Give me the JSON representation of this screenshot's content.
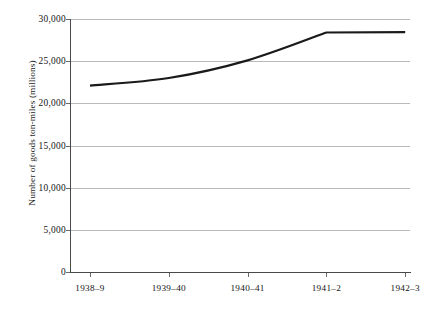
{
  "chart_data": {
    "type": "line",
    "title": "",
    "xlabel": "",
    "ylabel": "Number of goods ton-miles (millions)",
    "categories": [
      "1938–9",
      "1939–40",
      "1940–41",
      "1941–2",
      "1942–3"
    ],
    "values": [
      22100,
      23000,
      25100,
      28400,
      28450
    ],
    "series": [
      {
        "name": "Goods ton-miles",
        "values": [
          22100,
          23000,
          25100,
          28400,
          28450
        ],
        "color": "#1a1a1a"
      }
    ],
    "ylim": [
      0,
      30000
    ],
    "yticks": [
      0,
      5000,
      10000,
      15000,
      20000,
      25000,
      30000
    ],
    "ytick_labels": [
      "0",
      "5,000",
      "10,000",
      "15,000",
      "20,000",
      "25,000",
      "30,000"
    ],
    "grid": true,
    "grid_axis": "y",
    "legend": false,
    "legend_position": "none",
    "line_style": "solid",
    "line_width": 2.2,
    "markers": false
  },
  "colors": {
    "background": "#ffffff",
    "line": "#1a1a1a",
    "gridline": "#b9b9b9",
    "axis": "#4a4a4a",
    "text": "#121212"
  }
}
